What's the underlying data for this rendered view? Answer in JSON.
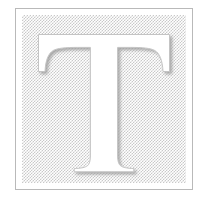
{
  "document": {
    "title": "Drop Cap Tile",
    "kind": "decorative-initial"
  },
  "tile": {
    "letter": "T",
    "letter_label": "T",
    "style": "serif-capital",
    "treatment": "white-knockout-on-halftone",
    "alt_text": "Decorative square tile containing a large white serif capital letter T on a gray halftone background"
  },
  "frame": {
    "label": "border-frame",
    "border_color": "#b9b9b9",
    "background_color": "#ffffff"
  },
  "field": {
    "label": "halftone-field",
    "pattern": "50% checkerboard dither",
    "tint_color": "#c9c9c9",
    "base_color": "#ffffff"
  },
  "glyph": {
    "fill_color": "#ffffff",
    "outline_color": "#c4c4c4",
    "shadow_color": "#a8a8a8",
    "highlight_color": "#ffffff"
  },
  "page": {
    "background_color": "#ffffff",
    "width": "212",
    "height": "205"
  }
}
